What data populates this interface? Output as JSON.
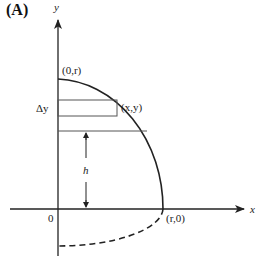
{
  "figure": {
    "panel_label": "(A)",
    "axes": {
      "x_label": "x",
      "y_label": "y",
      "origin_label": "0"
    },
    "points": {
      "top": "(0,r)",
      "right": "(r,0)",
      "on_curve": "(x,y)"
    },
    "annotations": {
      "strip_thickness": "Δy",
      "height": "h"
    },
    "colors": {
      "stroke": "#222222",
      "strip": "#555555",
      "background": "#ffffff"
    }
  }
}
